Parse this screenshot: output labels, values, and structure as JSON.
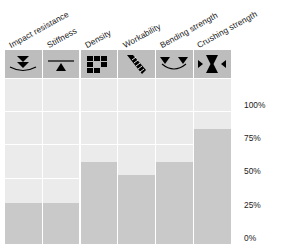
{
  "chart_data": {
    "type": "bar",
    "title": "",
    "xlabel": "",
    "ylabel": "",
    "ylim": [
      0,
      100
    ],
    "grid": true,
    "legend": "none",
    "axis_position": "right",
    "categories": [
      "Impact resistance",
      "Stiffness",
      "Density",
      "Workability",
      "Bending strength",
      "Crushing strength"
    ],
    "values": [
      25,
      25,
      50,
      42,
      50,
      70
    ],
    "tick_labels": [
      "100%",
      "75%",
      "50%",
      "25%",
      "0%"
    ],
    "tick_values": [
      100,
      75,
      50,
      25,
      0
    ],
    "icons": [
      "impact-arrow-down-on-curve-icon",
      "stiffness-line-with-up-triangle-icon",
      "density-block-squares-icon",
      "workability-chisel-tool-icon",
      "bending-two-down-triangles-curve-icon",
      "crushing-hourglass-inward-arrows-icon"
    ],
    "colors": {
      "background": "#ffffff",
      "cell": "#ebebeb",
      "bar": "#c9c9c9",
      "icon_cell": "#bdbdbd",
      "icon_glyph": "#000000",
      "text": "#1b1b1b",
      "gridline": "#ffffff"
    }
  }
}
